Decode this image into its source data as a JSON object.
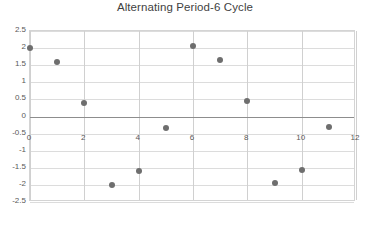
{
  "chart_data": {
    "type": "scatter",
    "title": "Alternating Period-6 Cycle",
    "xlabel": "",
    "ylabel": "",
    "xlim": [
      0,
      12
    ],
    "ylim": [
      -2.5,
      2.5
    ],
    "grid": true,
    "legend": "none",
    "marker_color": "#6e6e6e",
    "x_ticks": [
      "0",
      "2",
      "4",
      "6",
      "8",
      "10",
      "12"
    ],
    "x_tick_values": [
      0,
      2,
      4,
      6,
      8,
      10,
      12
    ],
    "y_ticks": [
      "2.5",
      "2",
      "1.5",
      "1",
      "0.5",
      "0",
      "-0.5",
      "-1",
      "-1.5",
      "-2",
      "-2.5"
    ],
    "y_tick_values": [
      2.5,
      2,
      1.5,
      1,
      0.5,
      0,
      -0.5,
      -1,
      -1.5,
      -2,
      -2.5
    ],
    "series": [
      {
        "name": "Orbit",
        "x": [
          0,
          1,
          2,
          3,
          4,
          5,
          6,
          7,
          8,
          9,
          10,
          11
        ],
        "values": [
          2.0,
          1.6,
          0.4,
          -2.0,
          -1.58,
          -0.35,
          2.05,
          1.65,
          0.45,
          -1.95,
          -1.55,
          -0.3
        ]
      }
    ]
  }
}
